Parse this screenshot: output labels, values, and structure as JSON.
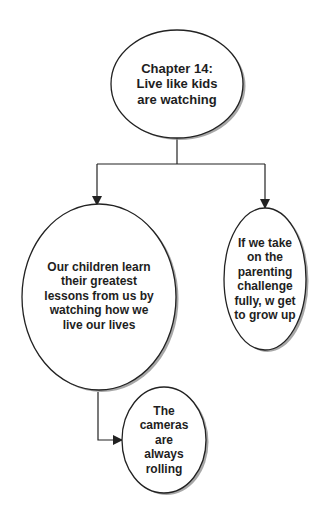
{
  "diagram": {
    "type": "flowchart",
    "colors": {
      "stroke": "#222222",
      "shadow": "#8a8a8a",
      "fill": "#ffffff",
      "text": "#1e1e1e"
    },
    "nodes": {
      "root": {
        "shape": "ellipse",
        "lines": [
          "Chapter 14:",
          "Live like kids",
          "are watching"
        ]
      },
      "left": {
        "shape": "ellipse",
        "lines": [
          "Our children learn",
          "their greatest",
          "lessons from us by",
          "watching how we",
          "live our lives"
        ]
      },
      "right": {
        "shape": "ellipse",
        "lines": [
          "If we take",
          "on the",
          "parenting",
          "challenge",
          "fully, w get",
          "to grow up"
        ]
      },
      "bottom": {
        "shape": "ellipse",
        "lines": [
          "The",
          "cameras",
          "are",
          "always",
          "rolling"
        ]
      }
    },
    "edges": [
      {
        "from": "root",
        "to": "left"
      },
      {
        "from": "root",
        "to": "right"
      },
      {
        "from": "left",
        "to": "bottom"
      }
    ]
  }
}
